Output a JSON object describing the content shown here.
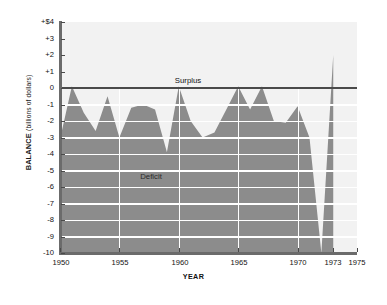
{
  "chart_data": {
    "type": "area",
    "title": "",
    "xlabel": "YEAR",
    "ylabel": "BALANCE",
    "ylabel_unit": "(billions of dollars)",
    "xlim": [
      1950,
      1975
    ],
    "ylim": [
      -10,
      4
    ],
    "grid": true,
    "grid_color": "#ffffff",
    "area_color": "#8a8a8a",
    "plot_bg": "#f2f2f2",
    "axis_color": "#5a5a5a",
    "zero_line_color": "#4a4a4a",
    "y_ticks": [
      "+$4",
      "+3",
      "+2",
      "+1",
      "0",
      "-1",
      "-2",
      "-3",
      "-4",
      "-5",
      "-6",
      "-7",
      "-8",
      "-9",
      "-10"
    ],
    "y_tick_values": [
      4,
      3,
      2,
      1,
      0,
      -1,
      -2,
      -3,
      -4,
      -5,
      -6,
      -7,
      -8,
      -9,
      -10
    ],
    "x_ticks": [
      "1950",
      "1955",
      "1960",
      "1965",
      "1970",
      "1973",
      "1975"
    ],
    "x_tick_values": [
      1950,
      1955,
      1960,
      1965,
      1970,
      1973,
      1975
    ],
    "annotations": [
      {
        "text": "Surplus",
        "x": 1963.0,
        "y": 0.55
      },
      {
        "text": "Deficit",
        "x": 1958.3,
        "y": -5.1
      }
    ],
    "x": [
      1950,
      1951,
      1952,
      1953,
      1954,
      1955,
      1956,
      1957,
      1958,
      1959,
      1960,
      1961,
      1962,
      1963,
      1964,
      1965,
      1966,
      1967,
      1968,
      1969,
      1970,
      1971,
      1972,
      1973
    ],
    "values": [
      -3.1,
      0.1,
      -1.5,
      -2.6,
      -0.5,
      -3.0,
      -1.2,
      -1.0,
      -1.3,
      -3.9,
      0.1,
      -2.0,
      -3.0,
      -2.7,
      -1.3,
      0.1,
      -1.3,
      0.1,
      -2.0,
      -2.1,
      -1.1,
      -3.0,
      -10.0,
      2.0
    ],
    "series_name": "Balance of payments"
  },
  "figure": {
    "background": "#ffffff"
  }
}
